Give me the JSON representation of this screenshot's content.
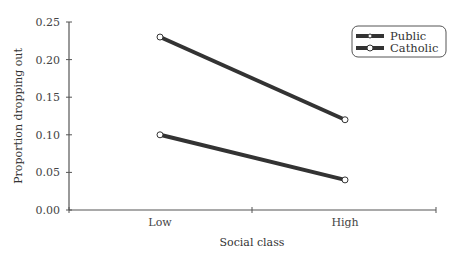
{
  "chart_data": {
    "type": "line",
    "title": "",
    "xlabel": "Social class",
    "ylabel": "Proportion dropping out",
    "categories": [
      "Low",
      "High"
    ],
    "series": [
      {
        "name": "Public",
        "values": [
          0.23,
          0.12
        ]
      },
      {
        "name": "Catholic",
        "values": [
          0.1,
          0.04
        ]
      }
    ],
    "ylim": [
      0,
      0.25
    ],
    "yticks": [
      "0.00",
      "0.05",
      "0.10",
      "0.15",
      "0.20",
      "0.25"
    ],
    "grid": false,
    "legend_position": "top-right",
    "colors": {
      "line": "#333333",
      "marker_fill": "#ffffff",
      "axis": "#555555"
    }
  }
}
